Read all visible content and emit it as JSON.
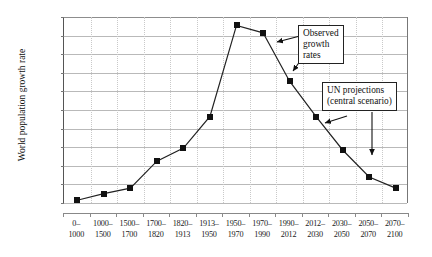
{
  "chart_data": {
    "type": "line",
    "title": "",
    "xlabel": "",
    "ylabel": "World population growth rate",
    "ylim": [
      0.0,
      2.0
    ],
    "ytick_labels": [
      "2.0%",
      "1.8%",
      "1.6%",
      "1.4%",
      "1.2%",
      "1.0%",
      "0.8%",
      "0.6%",
      "0.4%",
      "0.2%",
      "0.0%"
    ],
    "ytick_values": [
      2.0,
      1.8,
      1.6,
      1.4,
      1.2,
      1.0,
      0.8,
      0.6,
      0.4,
      0.2,
      0.0
    ],
    "grid": "horizontal solid, vertical dotted",
    "legend": "none",
    "categories": [
      "0–\n1000",
      "1000–\n1500",
      "1500–\n1700",
      "1700–\n1820",
      "1820–\n1913",
      "1913–\n1950",
      "1950–\n1970",
      "1970–\n1990",
      "1990–\n2012",
      "2012–\n2030",
      "2030–\n2050",
      "2050–\n2070",
      "2070–\n2100"
    ],
    "categories_line1": [
      "0–",
      "1000–",
      "1500–",
      "1700–",
      "1820–",
      "1913–",
      "1950–",
      "1970–",
      "1990–",
      "2012–",
      "2030–",
      "2050–",
      "2070–"
    ],
    "categories_line2": [
      "1000",
      "1500",
      "1700",
      "1820",
      "1913",
      "1950",
      "1970",
      "1990",
      "2012",
      "2030",
      "2050",
      "2070",
      "2100"
    ],
    "values": [
      0.03,
      0.1,
      0.16,
      0.45,
      0.59,
      0.93,
      1.91,
      1.83,
      1.31,
      0.93,
      0.57,
      0.28,
      0.16
    ],
    "marker_style": "filled square",
    "line_color": "#222222",
    "marker_color": "#111111"
  },
  "annotations": [
    {
      "id": "observed",
      "lines": [
        "Observed",
        "growth",
        "rates"
      ]
    },
    {
      "id": "un-projections",
      "lines": [
        "UN  projections",
        "(central scenario)"
      ]
    }
  ]
}
